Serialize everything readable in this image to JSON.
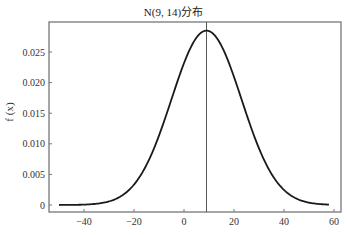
{
  "chart_data": {
    "type": "line",
    "title": "N(9, 14)分布",
    "xlabel": "",
    "ylabel": "f (x)",
    "distribution": {
      "family": "normal",
      "mean": 9,
      "sd": 14
    },
    "x_range": [
      -50,
      58
    ],
    "xlim": [
      -55,
      62
    ],
    "ylim": [
      -0.0012,
      0.0298
    ],
    "x_ticks": [
      -40,
      -20,
      0,
      20,
      40,
      60
    ],
    "x_tick_labels": [
      "-40",
      "-20",
      "0",
      "20",
      "40",
      "60"
    ],
    "y_ticks": [
      0,
      0.005,
      0.01,
      0.015,
      0.02,
      0.025
    ],
    "y_tick_labels": [
      "0",
      "0.005",
      "0.010",
      "0.015",
      "0.020",
      "0.025"
    ],
    "series": [
      {
        "name": "pdf",
        "x": [
          -50,
          -40,
          -30,
          -20,
          -10,
          0,
          5,
          9,
          15,
          20,
          30,
          40,
          50,
          58
        ],
        "values": [
          3e-05,
          0.00064,
          0.00259,
          0.00657,
          0.01139,
          0.02072,
          0.02734,
          0.0285,
          0.02606,
          0.02139,
          0.01132,
          0.00612,
          0.00056,
          0.00012
        ]
      }
    ],
    "annotations": [
      {
        "type": "vline",
        "x": 9,
        "label": "mean"
      }
    ],
    "grid": false,
    "legend": null
  },
  "colors": {
    "curve": "#1a1a1a",
    "vline": "#555555",
    "axes": "#777777"
  }
}
